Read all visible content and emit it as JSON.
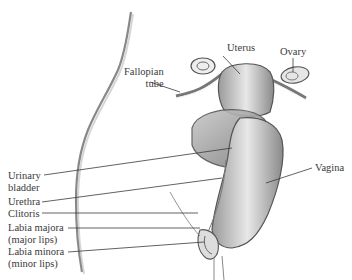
{
  "diagram": {
    "labels": {
      "uterus": "Uterus",
      "ovary": "Ovary",
      "fallopian_tube": [
        "Fallopian",
        "tube"
      ],
      "urinary_bladder": [
        "Urinary",
        "bladder"
      ],
      "urethra": "Urethra",
      "vagina": "Vagina",
      "clitoris": "Clitoris",
      "labia_majora": [
        "Labia majora",
        "(major lips)"
      ],
      "labia_minora": [
        "Labia minora",
        "(minor lips)"
      ]
    },
    "colors": {
      "ink": "#3a3a3a",
      "shade": "#8a8a8a",
      "background": "#ffffff"
    }
  }
}
